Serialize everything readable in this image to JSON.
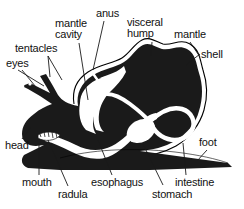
{
  "diagram": {
    "style": "black silhouette line drawing with leader-line callouts",
    "colors": {
      "body_fill": "#1a1a1a",
      "background": "#ffffff",
      "outline": "#000000",
      "organ_channel": "#ffffff",
      "leader_line": "#1a1a1a",
      "text": "#111111"
    },
    "labels": [
      {
        "id": "tentacles",
        "text": "tentacles",
        "x": 15,
        "y": 43,
        "lines": 1,
        "leaders": [
          {
            "x1": 48,
            "y1": 56,
            "x2": 62,
            "y2": 80
          },
          {
            "x1": 48,
            "y1": 56,
            "x2": 50,
            "y2": 77
          }
        ]
      },
      {
        "id": "eyes",
        "text": "eyes",
        "x": 6,
        "y": 58,
        "lines": 1,
        "leaders": [
          {
            "x1": 18,
            "y1": 70,
            "x2": 44,
            "y2": 86
          },
          {
            "x1": 22,
            "y1": 70,
            "x2": 40,
            "y2": 92
          }
        ]
      },
      {
        "id": "mantle-cavity",
        "text": "mantle\ncavity",
        "x": 55,
        "y": 18,
        "lines": 2,
        "leaders": [
          {
            "x1": 79,
            "y1": 43,
            "x2": 88,
            "y2": 100
          }
        ]
      },
      {
        "id": "anus",
        "text": "anus",
        "x": 96,
        "y": 8,
        "lines": 1,
        "leaders": [
          {
            "x1": 104,
            "y1": 21,
            "x2": 93,
            "y2": 70
          }
        ]
      },
      {
        "id": "visceral-hump",
        "text": "visceral\nhump",
        "x": 127,
        "y": 17,
        "lines": 2,
        "leaders": [
          {
            "x1": 152,
            "y1": 42,
            "x2": 151,
            "y2": 56
          }
        ]
      },
      {
        "id": "mantle",
        "text": "mantle",
        "x": 174,
        "y": 29,
        "lines": 1,
        "leaders": [
          {
            "x1": 190,
            "y1": 42,
            "x2": 200,
            "y2": 57
          }
        ]
      },
      {
        "id": "shell",
        "text": "shell",
        "x": 201,
        "y": 49,
        "lines": 1,
        "leaders": [
          {
            "x1": 200,
            "y1": 54,
            "x2": 186,
            "y2": 65
          }
        ]
      },
      {
        "id": "head",
        "text": "head",
        "x": 5,
        "y": 140,
        "lines": 1,
        "leaders": [
          {
            "x1": 22,
            "y1": 139,
            "x2": 31,
            "y2": 127
          }
        ]
      },
      {
        "id": "mouth",
        "text": "mouth",
        "x": 22,
        "y": 177,
        "lines": 1,
        "leaders": [
          {
            "x1": 39,
            "y1": 175,
            "x2": 39,
            "y2": 143
          }
        ]
      },
      {
        "id": "radula",
        "text": "radula",
        "x": 58,
        "y": 189,
        "lines": 1,
        "leaders": [
          {
            "x1": 68,
            "y1": 186,
            "x2": 48,
            "y2": 140
          }
        ]
      },
      {
        "id": "esophagus",
        "text": "esophagus",
        "x": 91,
        "y": 177,
        "lines": 1,
        "leaders": [
          {
            "x1": 112,
            "y1": 175,
            "x2": 98,
            "y2": 140
          }
        ]
      },
      {
        "id": "stomach",
        "text": "stomach",
        "x": 152,
        "y": 189,
        "lines": 1,
        "leaders": [
          {
            "x1": 163,
            "y1": 185,
            "x2": 143,
            "y2": 144
          }
        ]
      },
      {
        "id": "intestine",
        "text": "intestine",
        "x": 175,
        "y": 177,
        "lines": 1,
        "leaders": [
          {
            "x1": 186,
            "y1": 175,
            "x2": 183,
            "y2": 143
          }
        ]
      },
      {
        "id": "foot",
        "text": "foot",
        "x": 199,
        "y": 137,
        "lines": 1,
        "leaders": [
          {
            "x1": 207,
            "y1": 150,
            "x2": 197,
            "y2": 161
          }
        ]
      }
    ]
  }
}
